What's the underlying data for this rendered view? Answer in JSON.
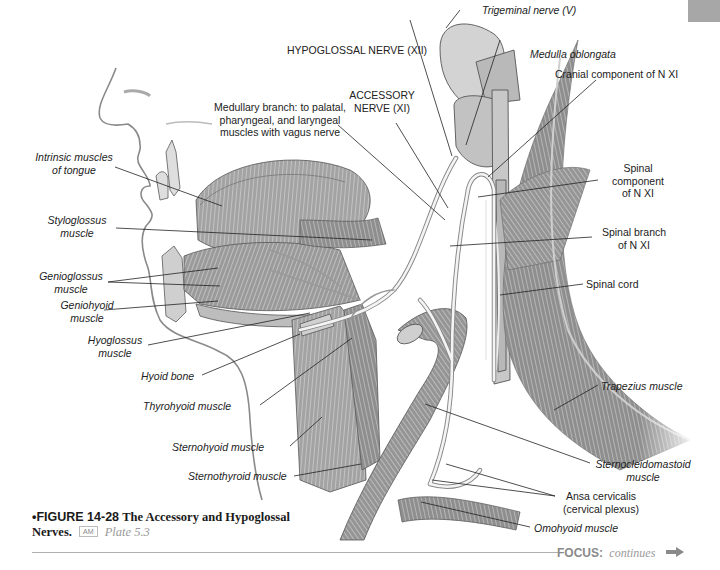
{
  "labels": {
    "trigeminal": "Trigeminal nerve (V)",
    "hypoglossal": "HYPOGLOSSAL NERVE (XII)",
    "medulla": "Medulla oblongata",
    "cranial_component": "Cranial component of N XI",
    "accessory_1": "ACCESSORY",
    "accessory_2": "NERVE (XI)",
    "medullary_1": "Medullary branch: to palatal,",
    "medullary_2": "pharyngeal, and laryngeal",
    "medullary_3": "muscles with vagus nerve",
    "intrinsic_1": "Intrinsic muscles",
    "intrinsic_2": "of tongue",
    "spinal_component_1": "Spinal",
    "spinal_component_2": "component",
    "spinal_component_3": "of N XI",
    "styloglossus_1": "Styloglossus",
    "styloglossus_2": "muscle",
    "spinal_branch_1": "Spinal branch",
    "spinal_branch_2": "of N XI",
    "genioglossus_1": "Genioglossus",
    "genioglossus_2": "muscle",
    "spinal_cord": "Spinal cord",
    "geniohyoid_1": "Geniohyoid",
    "geniohyoid_2": "muscle",
    "hyoglossus_1": "Hyoglossus",
    "hyoglossus_2": "muscle",
    "hyoid_bone": "Hyoid bone",
    "trapezius": "Trapezius muscle",
    "thyrohyoid": "Thyrohyoid muscle",
    "sternohyoid": "Sternohyoid muscle",
    "sternothyroid": "Sternothyroid muscle",
    "scm_1": "Sternocleidomastoid",
    "scm_2": "muscle",
    "ansa_1": "Ansa cervicalis",
    "ansa_2": "(cervical plexus)",
    "omohyoid": "Omohyoid muscle"
  },
  "caption": {
    "bullet": "•",
    "number": "FIGURE 14-28",
    "title_1": "The Accessory and Hypoglossal",
    "title_2": "Nerves.",
    "badge": "AM",
    "plate": "Plate 5.3"
  },
  "footer": {
    "focus_key": "FOCUS:",
    "focus_value": "continues",
    "arrow_icon": "right-arrow-icon"
  },
  "colors": {
    "tab": "#a7a7a7",
    "muscle": "#8c8c8c",
    "nerve": "#f2f2f2",
    "leader": "#222222",
    "focus": "#8a8a8a"
  }
}
